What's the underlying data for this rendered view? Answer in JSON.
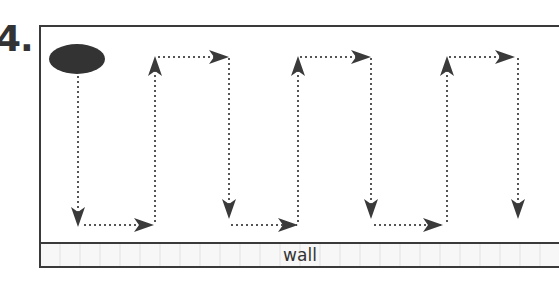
{
  "figure": {
    "number_label": "4.",
    "wall_label": "wall",
    "colors": {
      "stroke": "#3a3a3a",
      "dots": "#555555",
      "ellipse": "#333333",
      "wall_fill": "#f4f4f4"
    },
    "start_shape": "ellipse",
    "path_description": "Dotted boustrophedon (lawnmower) path starting at the dark ellipse, moving down, right along the wall, up, right, down, repeating",
    "path_points": [
      [
        78,
        75
      ],
      [
        78,
        225
      ],
      [
        155,
        225
      ],
      [
        155,
        57
      ],
      [
        229,
        57
      ],
      [
        229,
        225
      ],
      [
        298,
        225
      ],
      [
        298,
        57
      ],
      [
        371,
        57
      ],
      [
        371,
        225
      ],
      [
        447,
        225
      ],
      [
        447,
        57
      ],
      [
        518,
        57
      ],
      [
        518,
        218
      ]
    ]
  }
}
